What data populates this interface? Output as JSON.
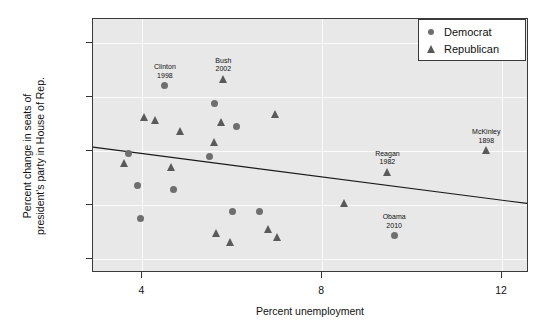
{
  "chart_data": {
    "type": "scatter",
    "title": "",
    "xlabel": "Percent unemployment",
    "ylabel": "Percent change in seats of\npresident's party in House of Rep.",
    "xlim": [
      2.9,
      12.6
    ],
    "ylim": [
      -32.5,
      14.5
    ],
    "xticks": [
      4,
      8,
      12
    ],
    "xtick_labels": [
      "4",
      "8",
      "12"
    ],
    "yticks": [
      10,
      0,
      -10,
      -20,
      -30
    ],
    "ytick_labels": [
      "10",
      "0",
      "−10",
      "−20",
      "−30"
    ],
    "grid": true,
    "legend_position": "top-right",
    "legend": [
      {
        "label": "Democrat",
        "marker": "circle",
        "color": "#6e6e6e"
      },
      {
        "label": "Republican",
        "marker": "triangle",
        "color": "#5a5a5a"
      }
    ],
    "series": [
      {
        "name": "Democrat",
        "marker": "circle",
        "color": "#6e6e6e",
        "points": [
          {
            "x": 4.5,
            "y": 2.2,
            "label": "Clinton\n1998"
          },
          {
            "x": 5.6,
            "y": -1.2,
            "label": ""
          },
          {
            "x": 6.1,
            "y": -5.3,
            "label": ""
          },
          {
            "x": 3.7,
            "y": -10.3,
            "label": ""
          },
          {
            "x": 5.5,
            "y": -10.9,
            "label": ""
          },
          {
            "x": 3.9,
            "y": -16.4,
            "label": ""
          },
          {
            "x": 4.7,
            "y": -17.0,
            "label": ""
          },
          {
            "x": 6.0,
            "y": -21.2,
            "label": ""
          },
          {
            "x": 6.6,
            "y": -21.2,
            "label": ""
          },
          {
            "x": 3.95,
            "y": -22.4,
            "label": ""
          },
          {
            "x": 9.6,
            "y": -25.5,
            "label": "Obama\n2010"
          }
        ]
      },
      {
        "name": "Republican",
        "marker": "triangle",
        "color": "#5a5a5a",
        "points": [
          {
            "x": 5.8,
            "y": 3.4,
            "label": "Bush\n2002"
          },
          {
            "x": 6.95,
            "y": -3.0,
            "label": ""
          },
          {
            "x": 4.05,
            "y": -3.6,
            "label": ""
          },
          {
            "x": 4.3,
            "y": -4.2,
            "label": ""
          },
          {
            "x": 5.75,
            "y": -4.6,
            "label": ""
          },
          {
            "x": 4.85,
            "y": -6.3,
            "label": ""
          },
          {
            "x": 5.6,
            "y": -8.3,
            "label": ""
          },
          {
            "x": 11.65,
            "y": -9.8,
            "label": "McKinley\n1898"
          },
          {
            "x": 3.6,
            "y": -12.2,
            "label": ""
          },
          {
            "x": 4.65,
            "y": -12.8,
            "label": ""
          },
          {
            "x": 9.45,
            "y": -13.8,
            "label": "Reagan\n1982"
          },
          {
            "x": 8.5,
            "y": -19.6,
            "label": ""
          },
          {
            "x": 6.8,
            "y": -24.4,
            "label": ""
          },
          {
            "x": 5.65,
            "y": -25.1,
            "label": ""
          },
          {
            "x": 7.0,
            "y": -25.8,
            "label": ""
          },
          {
            "x": 5.95,
            "y": -26.7,
            "label": ""
          }
        ]
      }
    ],
    "trendline": {
      "type": "linear",
      "x_start": 2.9,
      "y_start": -9.4,
      "x_end": 12.6,
      "y_end": -19.9,
      "color": "#1a1a1a"
    },
    "annotations": [
      {
        "text": "Clinton\n1998",
        "x": 4.5,
        "y": 2.2
      },
      {
        "text": "Bush\n2002",
        "x": 5.8,
        "y": 3.4
      },
      {
        "text": "McKinley\n1898",
        "x": 11.65,
        "y": -9.8
      },
      {
        "text": "Reagan\n1982",
        "x": 9.45,
        "y": -13.8
      },
      {
        "text": "Obama\n2010",
        "x": 9.6,
        "y": -25.5
      }
    ]
  }
}
